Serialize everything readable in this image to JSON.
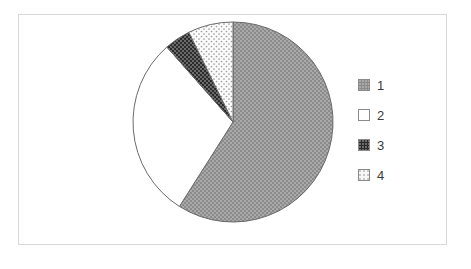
{
  "frame": {
    "border_color": "#d8d8d8",
    "background": "#ffffff"
  },
  "chart_data": {
    "type": "pie",
    "title": "",
    "subtitle": "",
    "xlabel": "",
    "ylabel": "",
    "grid": false,
    "legend_position": "right",
    "categories": [
      "1",
      "2",
      "3",
      "4"
    ],
    "values": [
      59,
      29.5,
      4.2,
      7.3
    ],
    "units": "percent",
    "start_angle_deg": 0,
    "direction": "clockwise",
    "slices": [
      {
        "label": "1",
        "value": 59,
        "start_deg": 0,
        "end_deg": 212.4,
        "fill": "#8b8b8b",
        "pattern": "fine-dot-light-on-gray",
        "stroke": "#555555"
      },
      {
        "label": "2",
        "value": 29.5,
        "start_deg": 212.4,
        "end_deg": 318.6,
        "fill": "#ffffff",
        "pattern": "none",
        "stroke": "#555555"
      },
      {
        "label": "3",
        "value": 4.2,
        "start_deg": 318.6,
        "end_deg": 333.8,
        "fill": "#2b2b2b",
        "pattern": "fine-dot-light-on-black",
        "stroke": "#555555"
      },
      {
        "label": "4",
        "value": 7.3,
        "start_deg": 333.8,
        "end_deg": 360,
        "fill": "#f7f7f7",
        "pattern": "sparse-dot-gray-on-white",
        "stroke": "#555555"
      }
    ],
    "geometry": {
      "center_x": 233,
      "center_y": 122,
      "radius": 100
    }
  },
  "legend": {
    "items": [
      {
        "label": "1",
        "swatch": "legend-swatch-pattern-1"
      },
      {
        "label": "2",
        "swatch": "legend-swatch-pattern-2"
      },
      {
        "label": "3",
        "swatch": "legend-swatch-pattern-3"
      },
      {
        "label": "4",
        "swatch": "legend-swatch-pattern-4"
      }
    ]
  }
}
